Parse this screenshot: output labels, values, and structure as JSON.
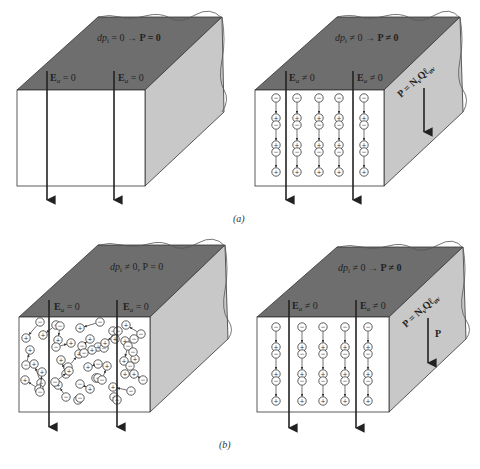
{
  "figure": {
    "panels": [
      {
        "id": "a-left",
        "top_label": "dp_i = 0 → P = 0",
        "top_label_parts": {
          "lhs": "dp",
          "sub": "i",
          "rhs": "= 0",
          "arrow": "→",
          "result": "P = 0"
        },
        "field_labels": [
          "E₀ = 0",
          "E₀ = 0"
        ],
        "field_label_parts": [
          {
            "base": "E",
            "sub": "a",
            "rel": "= 0"
          },
          {
            "base": "E",
            "sub": "a",
            "rel": "= 0"
          }
        ]
      },
      {
        "id": "a-right",
        "top_label_parts": {
          "lhs": "dp",
          "sub": "i",
          "rhs": "≠ 0",
          "arrow": "→",
          "result": "P ≠ 0"
        },
        "field_label_parts": [
          {
            "base": "E",
            "sub": "a",
            "rel": "≠ 0"
          },
          {
            "base": "E",
            "sub": "a",
            "rel": "≠ 0"
          }
        ],
        "side_label": "P = N",
        "side_label_sub": "v",
        "side_label_tail": "Qℓ",
        "side_label_tail_sub": "av"
      },
      {
        "id": "b-left",
        "top_label_parts": {
          "lhs": "dp",
          "sub": "i",
          "rhs": "≠ 0, P = 0"
        },
        "field_label_parts": [
          {
            "base": "E",
            "sub": "a",
            "rel": "= 0"
          },
          {
            "base": "E",
            "sub": "a",
            "rel": "= 0"
          }
        ]
      },
      {
        "id": "b-right",
        "top_label_parts": {
          "lhs": "dp",
          "sub": "i",
          "rhs": "≠ 0",
          "arrow": "→",
          "result": "P ≠ 0"
        },
        "field_label_parts": [
          {
            "base": "E",
            "sub": "a",
            "rel": "≠ 0"
          },
          {
            "base": "E",
            "sub": "a",
            "rel": "≠ 0"
          }
        ],
        "side_label": "P = N",
        "side_label_sub": "v",
        "side_label_tail": "Qℓ",
        "side_label_tail_sub": "av",
        "side_arrow_label": "P"
      }
    ],
    "captions": {
      "a": "(a)",
      "b": "(b)"
    },
    "charges": {
      "plus": "+",
      "minus": "−"
    }
  },
  "colors": {
    "top_face": "#6e6e6e",
    "side_face": "#c8c8c8",
    "front_face": "#ffffff",
    "stroke": "#333333"
  }
}
